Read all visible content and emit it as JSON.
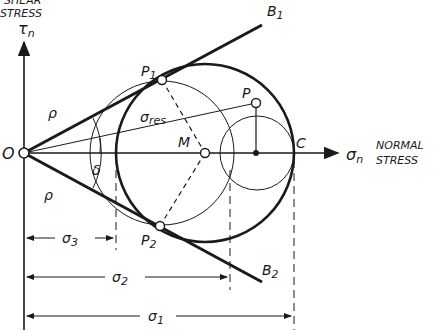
{
  "axes": {
    "y_label_line1": "SHEAR",
    "y_label_line2": "STRESS",
    "y_symbol": "τ",
    "y_symbol_sub": "n",
    "x_symbol": "σ",
    "x_symbol_sub": "n",
    "x_label_line1": "NORMAL",
    "x_label_line2": "STRESS"
  },
  "points": {
    "origin": "O",
    "center": "M",
    "C": "C",
    "P": "P",
    "P1": "P",
    "P1_sub": "1",
    "P2": "P",
    "P2_sub": "2"
  },
  "lines": {
    "B1": "B",
    "B1_sub": "1",
    "B2": "B",
    "B2_sub": "2",
    "sigma_res": "σ",
    "sigma_res_sub": "res"
  },
  "angles": {
    "rho_upper": "ρ",
    "rho_lower": "ρ",
    "delta": "δ"
  },
  "dimensions": {
    "sigma3": "σ",
    "sigma3_sub": "3",
    "sigma2": "σ",
    "sigma2_sub": "2",
    "sigma1": "σ",
    "sigma1_sub": "1"
  },
  "colors": {
    "ink": "#1a1a1a",
    "background": "#ffffff"
  }
}
